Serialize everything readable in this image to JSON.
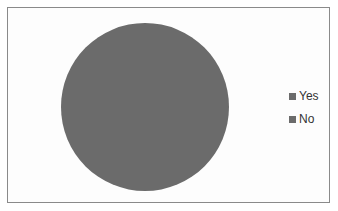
{
  "chart_data": {
    "type": "pie",
    "title": "",
    "categories": [
      "Yes",
      "No"
    ],
    "values": [
      0,
      100
    ],
    "colors": [
      "#6b6b6b",
      "#6b6b6b"
    ],
    "legend": {
      "position": "right",
      "entries": [
        "Yes",
        "No"
      ]
    },
    "note": "Pie renders as a single solid gray disk; no slice boundary visible"
  },
  "legend": {
    "items": [
      {
        "label": "Yes",
        "color": "#6b6b6b"
      },
      {
        "label": "No",
        "color": "#6b6b6b"
      }
    ]
  },
  "pie": {
    "cx": 145,
    "cy": 107,
    "r": 84,
    "fill": "#6b6b6b"
  }
}
